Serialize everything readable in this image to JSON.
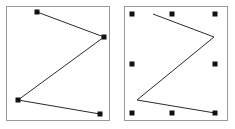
{
  "figure": {
    "background_color": "#ffffff",
    "width": 235,
    "height": 129
  },
  "style": {
    "panel_border_color": "#9a9a9a",
    "panel_fill_color": "#ffffff",
    "stroke_color": "#2b2b2b",
    "handle_color": "#111111",
    "handle_size": 5,
    "stroke_width": 1
  },
  "panels": [
    {
      "id": "node-edit",
      "name": "Node edit selection",
      "label": "",
      "frame": {
        "x": 6,
        "y": 6,
        "width": 104,
        "height": 115
      },
      "selection_mode": "node-handles",
      "path_points": [
        {
          "x": 31,
          "y": 6
        },
        {
          "x": 98,
          "y": 31
        },
        {
          "x": 12,
          "y": 94
        },
        {
          "x": 94,
          "y": 108
        }
      ],
      "handles": [
        {
          "x": 31,
          "y": 6,
          "name": "node-handle-1"
        },
        {
          "x": 98,
          "y": 31,
          "name": "node-handle-2"
        },
        {
          "x": 12,
          "y": 94,
          "name": "node-handle-3"
        },
        {
          "x": 94,
          "y": 108,
          "name": "node-handle-4"
        }
      ]
    },
    {
      "id": "object-select",
      "name": "Object bounding box selection",
      "label": "",
      "frame": {
        "x": 124,
        "y": 6,
        "width": 104,
        "height": 115
      },
      "selection_mode": "bounding-box-handles",
      "path_points": [
        {
          "x": 29,
          "y": 8
        },
        {
          "x": 90,
          "y": 31
        },
        {
          "x": 13,
          "y": 94
        },
        {
          "x": 91,
          "y": 107
        }
      ],
      "handles": [
        {
          "x": 8,
          "y": 8,
          "name": "bbox-handle-top-left"
        },
        {
          "x": 48,
          "y": 8,
          "name": "bbox-handle-top-center"
        },
        {
          "x": 91,
          "y": 8,
          "name": "bbox-handle-top-right"
        },
        {
          "x": 8,
          "y": 58,
          "name": "bbox-handle-middle-left"
        },
        {
          "x": 91,
          "y": 58,
          "name": "bbox-handle-middle-right"
        },
        {
          "x": 8,
          "y": 107,
          "name": "bbox-handle-bottom-left"
        },
        {
          "x": 48,
          "y": 107,
          "name": "bbox-handle-bottom-center"
        },
        {
          "x": 91,
          "y": 107,
          "name": "bbox-handle-bottom-right"
        }
      ]
    }
  ]
}
